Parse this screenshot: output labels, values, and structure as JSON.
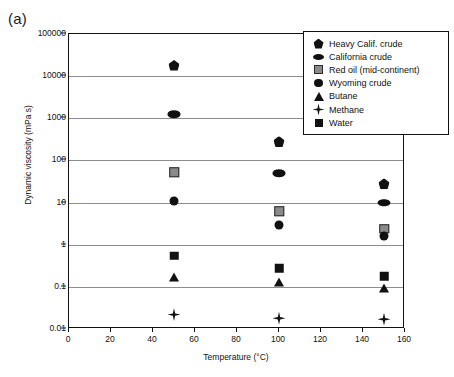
{
  "panel": {
    "label": "(a)"
  },
  "chart_data": {
    "type": "scatter",
    "title": "",
    "xlabel": "Temperature (°C)",
    "ylabel": "Dynamic viscosity (mPa s)",
    "xlim": [
      0,
      160
    ],
    "ylim": [
      0.01,
      100000
    ],
    "yscale": "log",
    "xscale": "linear",
    "grid": "horizontal",
    "legend_position": "upper-right",
    "xticks": [
      0,
      20,
      40,
      60,
      80,
      100,
      120,
      140,
      160
    ],
    "xtick_labels": [
      "0",
      "20",
      "40",
      "60",
      "80",
      "100",
      "120",
      "140",
      "160"
    ],
    "yticks": [
      0.01,
      0.1,
      1,
      10,
      100,
      1000,
      10000,
      100000
    ],
    "ytick_labels": [
      "0.01",
      "0.1",
      "1",
      "10",
      "100",
      "1000",
      "10000",
      "100000"
    ],
    "x": [
      50,
      100,
      150
    ],
    "series": [
      {
        "name": "Heavy Calif. crude",
        "marker": "pentagon",
        "color": "#111111",
        "values": [
          18000,
          280,
          28
        ]
      },
      {
        "name": "California crude",
        "marker": "ellipse",
        "color": "#111111",
        "values": [
          1250,
          50,
          10
        ]
      },
      {
        "name": "Red oil (mid-continent)",
        "marker": "gray-square",
        "color": "#8a8a8a",
        "values": [
          52,
          6.2,
          2.4
        ]
      },
      {
        "name": "Wyoming crude",
        "marker": "circle",
        "color": "#111111",
        "values": [
          11,
          3.0,
          1.6
        ]
      },
      {
        "name": "Butane",
        "marker": "triangle",
        "color": "#111111",
        "values": [
          0.17,
          0.13,
          0.095
        ]
      },
      {
        "name": "Methane",
        "marker": "star",
        "color": "#111111",
        "values": [
          0.022,
          0.018,
          0.017
        ]
      },
      {
        "name": "Water",
        "marker": "black-square",
        "color": "#111111",
        "values": [
          0.55,
          0.28,
          0.18
        ]
      }
    ]
  }
}
